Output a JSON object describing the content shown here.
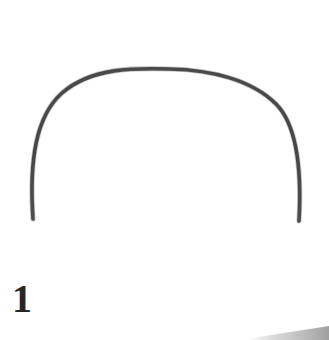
{
  "plate": {
    "width": 329,
    "height": 340,
    "background_color": "#ffffff",
    "label": "1",
    "label_color": "#262626",
    "caption_position": "lower-left"
  },
  "artifact": {
    "name": "curved-arc-object",
    "description": "single thin curved arc, inverted-U / bow shape, open at the bottom",
    "stroke_color": "#3a3a3c",
    "stroke_width": 3.6,
    "apex_x": 170,
    "apex_y": 69,
    "left_end_x": 33,
    "left_end_y": 219,
    "right_end_x": 299,
    "right_end_y": 221,
    "leftmost_x": 31,
    "rightmost_x": 301,
    "path": "M 33 219 C 29 160 36 116 62 93 C 92 67 135 68 170 69 C 212 70 252 80 276 104 C 296 124 302 166 299 221"
  },
  "corner_shadow": {
    "name": "bottom-right-shadow-wedge",
    "color": "#9a9a9a",
    "tint": "#d6d6d6",
    "from_x": 245,
    "to_x": 329,
    "bottom_y": 340
  }
}
